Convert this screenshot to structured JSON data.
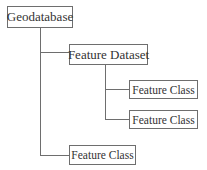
{
  "diagram": {
    "type": "tree",
    "root": {
      "label": "Geodatabase",
      "children": [
        {
          "label": "Feature Dataset",
          "children": [
            {
              "label": "Feature Class"
            },
            {
              "label": "Feature Class"
            }
          ]
        },
        {
          "label": "Feature Class"
        }
      ]
    },
    "colors": {
      "line": "#6e6e6e",
      "text": "#333333",
      "background": "#ffffff"
    }
  },
  "nodes": {
    "geodatabase": "Geodatabase",
    "feature_dataset": "Feature Dataset",
    "feature_class_1": "Feature Class",
    "feature_class_2": "Feature Class",
    "feature_class_3": "Feature Class"
  }
}
